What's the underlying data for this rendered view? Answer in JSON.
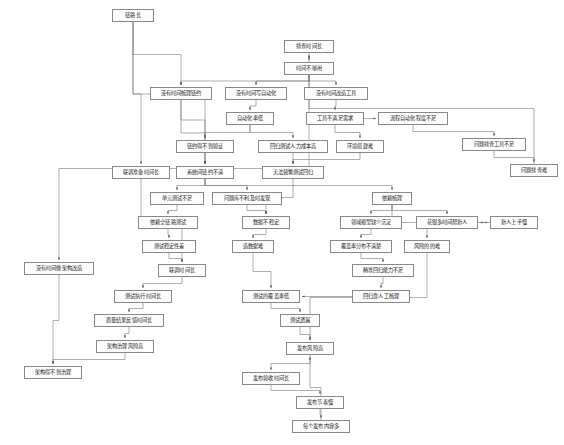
{
  "diagram": {
    "type": "causal-issue-tree",
    "language": "zh-CN",
    "style": {
      "node_fill": "#fdfdfd",
      "node_border": "#888888",
      "edge_color": "#777777",
      "text_color": "#1a1a1a",
      "background": "#ffffff"
    },
    "nodes": [
      {
        "id": "n1",
        "label": "链路长",
        "x": 112,
        "y": 9,
        "w": 42,
        "h": 13
      },
      {
        "id": "n2",
        "label": "排查时间长",
        "x": 284,
        "y": 40,
        "w": 50,
        "h": 13
      },
      {
        "id": "n3",
        "label": "时间不够用",
        "x": 284,
        "y": 62,
        "w": 50,
        "h": 13
      },
      {
        "id": "n4",
        "label": "没有时间梳理链约",
        "x": 150,
        "y": 87,
        "w": 62,
        "h": 13
      },
      {
        "id": "n5",
        "label": "没有时间写自动化",
        "x": 225,
        "y": 87,
        "w": 62,
        "h": 13
      },
      {
        "id": "n6",
        "label": "没有时间改造工具",
        "x": 304,
        "y": 87,
        "w": 64,
        "h": 13
      },
      {
        "id": "n7",
        "label": "自动化率低",
        "x": 226,
        "y": 112,
        "w": 48,
        "h": 13
      },
      {
        "id": "n8",
        "label": "工具不满足需求",
        "x": 306,
        "y": 112,
        "w": 58,
        "h": 13
      },
      {
        "id": "n9",
        "label": "流程自动化程度不足",
        "x": 378,
        "y": 112,
        "w": 70,
        "h": 13
      },
      {
        "id": "n10",
        "label": "问题排查工具不足",
        "x": 462,
        "y": 138,
        "w": 64,
        "h": 13
      },
      {
        "id": "n11",
        "label": "链约得不到验证",
        "x": 176,
        "y": 140,
        "w": 58,
        "h": 13
      },
      {
        "id": "n12",
        "label": "回归测试人力成本高",
        "x": 258,
        "y": 140,
        "w": 70,
        "h": 13
      },
      {
        "id": "n13",
        "label": "环境搭建难",
        "x": 336,
        "y": 140,
        "w": 48,
        "h": 13
      },
      {
        "id": "n14",
        "label": "问题排查难",
        "x": 510,
        "y": 164,
        "w": 48,
        "h": 13
      },
      {
        "id": "n15",
        "label": "联调准备时间长",
        "x": 112,
        "y": 166,
        "w": 58,
        "h": 13
      },
      {
        "id": "n16",
        "label": "系统间链约不清",
        "x": 176,
        "y": 166,
        "w": 58,
        "h": 13
      },
      {
        "id": "n17",
        "label": "无法频繁测试回归",
        "x": 262,
        "y": 166,
        "w": 62,
        "h": 13
      },
      {
        "id": "n18",
        "label": "单元测试不足",
        "x": 150,
        "y": 192,
        "w": 54,
        "h": 13
      },
      {
        "id": "n19",
        "label": "问题库不利及时发现",
        "x": 212,
        "y": 192,
        "w": 70,
        "h": 13
      },
      {
        "id": "n20",
        "label": "依赖梳理",
        "x": 372,
        "y": 192,
        "w": 40,
        "h": 13
      },
      {
        "id": "n21",
        "label": "依赖全链路测试",
        "x": 138,
        "y": 216,
        "w": 60,
        "h": 13
      },
      {
        "id": "n22",
        "label": "数据不稳定",
        "x": 242,
        "y": 216,
        "w": 48,
        "h": 13
      },
      {
        "id": "n23",
        "label": "领域模型缺少沉淀",
        "x": 340,
        "y": 216,
        "w": 62,
        "h": 13
      },
      {
        "id": "n24",
        "label": "花很多时间帮新人",
        "x": 416,
        "y": 216,
        "w": 62,
        "h": 13
      },
      {
        "id": "n25",
        "label": "新人上手慢",
        "x": 490,
        "y": 216,
        "w": 48,
        "h": 13
      },
      {
        "id": "n26",
        "label": "测试稳定性差",
        "x": 142,
        "y": 240,
        "w": 54,
        "h": 13
      },
      {
        "id": "n27",
        "label": "造数据难",
        "x": 232,
        "y": 240,
        "w": 42,
        "h": 13
      },
      {
        "id": "n28",
        "label": "覆盖率分布不清楚",
        "x": 330,
        "y": 240,
        "w": 62,
        "h": 13
      },
      {
        "id": "n29",
        "label": "风险的的难",
        "x": 404,
        "y": 240,
        "w": 46,
        "h": 13
      },
      {
        "id": "n30",
        "label": "联调时间长",
        "x": 158,
        "y": 264,
        "w": 48,
        "h": 13
      },
      {
        "id": "n31",
        "label": "精准回归能力不足",
        "x": 352,
        "y": 264,
        "w": 62,
        "h": 13
      },
      {
        "id": "n32",
        "label": "测试执行时间长",
        "x": 114,
        "y": 290,
        "w": 58,
        "h": 13
      },
      {
        "id": "n33",
        "label": "测试的覆盖率低",
        "x": 242,
        "y": 290,
        "w": 58,
        "h": 13
      },
      {
        "id": "n34",
        "label": "回归靠人工梳理",
        "x": 352,
        "y": 290,
        "w": 58,
        "h": 13
      },
      {
        "id": "n35",
        "label": "质量结果反馈时间长",
        "x": 94,
        "y": 314,
        "w": 70,
        "h": 13
      },
      {
        "id": "n36",
        "label": "测试遗漏",
        "x": 280,
        "y": 314,
        "w": 40,
        "h": 13
      },
      {
        "id": "n37",
        "label": "没有时间做架构改造",
        "x": 24,
        "y": 262,
        "w": 70,
        "h": 13
      },
      {
        "id": "n38",
        "label": "架构治理风险高",
        "x": 96,
        "y": 340,
        "w": 58,
        "h": 13
      },
      {
        "id": "n39",
        "label": "发布风险高",
        "x": 286,
        "y": 342,
        "w": 48,
        "h": 13
      },
      {
        "id": "n40",
        "label": "架构得不到治理",
        "x": 24,
        "y": 366,
        "w": 58,
        "h": 13
      },
      {
        "id": "n41",
        "label": "发布验收时间长",
        "x": 242,
        "y": 372,
        "w": 58,
        "h": 13
      },
      {
        "id": "n42",
        "label": "发布节奏慢",
        "x": 296,
        "y": 396,
        "w": 48,
        "h": 13
      },
      {
        "id": "n43",
        "label": "每个发布内容多",
        "x": 292,
        "y": 420,
        "w": 58,
        "h": 13
      }
    ],
    "edges": [
      {
        "from": "n1",
        "to": "n4"
      },
      {
        "from": "n1",
        "to": "n15"
      },
      {
        "from": "n1",
        "to": "n16"
      },
      {
        "from": "n2",
        "to": "n3"
      },
      {
        "from": "n3",
        "to": "n4"
      },
      {
        "from": "n3",
        "to": "n5"
      },
      {
        "from": "n3",
        "to": "n6"
      },
      {
        "from": "n3",
        "to": "n37"
      },
      {
        "from": "n4",
        "to": "n11"
      },
      {
        "from": "n4",
        "to": "n16"
      },
      {
        "from": "n5",
        "to": "n7"
      },
      {
        "from": "n6",
        "to": "n8"
      },
      {
        "from": "n7",
        "to": "n11"
      },
      {
        "from": "n7",
        "to": "n12"
      },
      {
        "from": "n8",
        "to": "n9"
      },
      {
        "from": "n8",
        "to": "n13"
      },
      {
        "from": "n9",
        "to": "n10"
      },
      {
        "from": "n10",
        "to": "n14"
      },
      {
        "from": "n11",
        "to": "n16"
      },
      {
        "from": "n12",
        "to": "n17"
      },
      {
        "from": "n13",
        "to": "n17"
      },
      {
        "from": "n14",
        "to": "n2"
      },
      {
        "from": "n15",
        "to": "n30"
      },
      {
        "from": "n16",
        "to": "n18"
      },
      {
        "from": "n16",
        "to": "n19"
      },
      {
        "from": "n16",
        "to": "n20"
      },
      {
        "from": "n17",
        "to": "n22"
      },
      {
        "from": "n18",
        "to": "n21"
      },
      {
        "from": "n19",
        "to": "n22"
      },
      {
        "from": "n20",
        "to": "n23"
      },
      {
        "from": "n20",
        "to": "n24"
      },
      {
        "from": "n20",
        "to": "n29"
      },
      {
        "from": "n21",
        "to": "n26"
      },
      {
        "from": "n22",
        "to": "n27"
      },
      {
        "from": "n23",
        "to": "n28"
      },
      {
        "from": "n24",
        "to": "n25"
      },
      {
        "from": "n25",
        "to": "n24"
      },
      {
        "from": "n26",
        "to": "n30"
      },
      {
        "from": "n27",
        "to": "n33"
      },
      {
        "from": "n28",
        "to": "n31"
      },
      {
        "from": "n29",
        "to": "n39"
      },
      {
        "from": "n30",
        "to": "n32"
      },
      {
        "from": "n31",
        "to": "n34"
      },
      {
        "from": "n32",
        "to": "n35"
      },
      {
        "from": "n33",
        "to": "n36"
      },
      {
        "from": "n34",
        "to": "n33"
      },
      {
        "from": "n35",
        "to": "n38"
      },
      {
        "from": "n36",
        "to": "n39"
      },
      {
        "from": "n37",
        "to": "n40"
      },
      {
        "from": "n38",
        "to": "n40"
      },
      {
        "from": "n39",
        "to": "n41"
      },
      {
        "from": "n41",
        "to": "n42"
      },
      {
        "from": "n42",
        "to": "n43"
      },
      {
        "from": "n43",
        "to": "n39"
      }
    ]
  }
}
